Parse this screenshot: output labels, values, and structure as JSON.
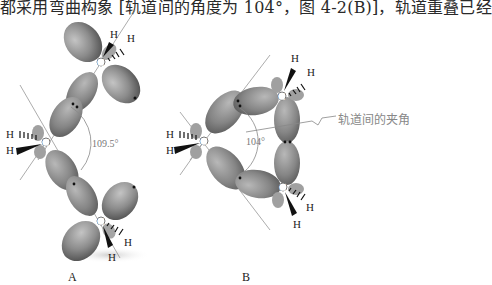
{
  "header": {
    "text": "都采用弯曲构象 [轨道间的角度为 104°，图 4-2(B)]，轨道重叠已经"
  },
  "figure": {
    "panel_a": {
      "label": "A",
      "angle_label": "109.5°",
      "atom_label": "C",
      "h_label": "H"
    },
    "panel_b": {
      "label": "B",
      "angle_label": "104°",
      "annotation": "轨道间的夹角",
      "atom_label": "C",
      "h_label": "H"
    },
    "colors": {
      "lobe": "#8c8c8c",
      "lobe_dark": "#5e5e5e",
      "lobe_light": "#bdbdbd",
      "axis_line": "#888888",
      "text": "#222222"
    }
  }
}
